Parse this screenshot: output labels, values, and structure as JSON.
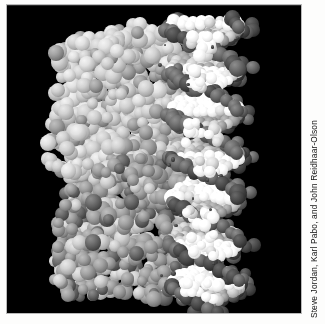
{
  "figure": {
    "credit": "Steve Jordan, Karl Pabo, and John Reidhaar-Olson",
    "alt_description": "Grayscale space-filling molecular model of a protein bound to a DNA double helix",
    "plate_background": "#000000",
    "page_background": "#fdfdfc"
  },
  "molecule": {
    "subject": "protein-DNA complex",
    "representation": "space-filling (CPK) spheres",
    "color_mode": "grayscale",
    "components": [
      {
        "name": "protein-domain-upper",
        "label": "Upper protein domain",
        "shade": "light gray",
        "hex": "#cfcfcf"
      },
      {
        "name": "protein-domain-lower",
        "label": "Lower protein domain",
        "shade": "medium gray",
        "hex": "#7c7c7c"
      },
      {
        "name": "dna-backbone",
        "label": "DNA sugar-phosphate backbone",
        "shade": "dark gray",
        "hex": "#4e4e4e"
      },
      {
        "name": "dna-bases",
        "label": "DNA bases / groove surface",
        "shade": "white",
        "hex": "#f5f5f5"
      }
    ]
  }
}
